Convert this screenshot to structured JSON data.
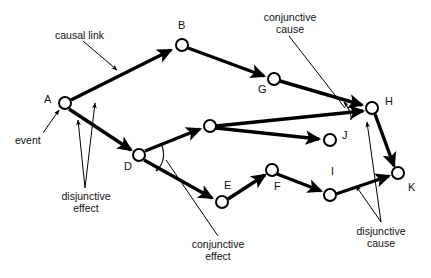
{
  "figure": {
    "type": "causal-network-diagram",
    "background": "#ffffff",
    "ink": "#000000",
    "width": 431,
    "height": 278
  },
  "nodes": [
    {
      "id": "A",
      "label": "A",
      "cx": 65,
      "cy": 103,
      "r": 6.0,
      "label_x": 44,
      "label_y": 94
    },
    {
      "id": "B",
      "label": "B",
      "cx": 182,
      "cy": 45,
      "r": 6.0,
      "label_x": 178,
      "label_y": 20
    },
    {
      "id": "G",
      "label": "G",
      "cx": 274,
      "cy": 79,
      "r": 6.0,
      "label_x": 258,
      "label_y": 84
    },
    {
      "id": "H",
      "label": "H",
      "cx": 372,
      "cy": 108,
      "r": 6.0,
      "label_x": 385,
      "label_y": 96
    },
    {
      "id": "C",
      "label": "",
      "cx": 210,
      "cy": 126,
      "r": 6.0,
      "label_x": 0,
      "label_y": 0
    },
    {
      "id": "D",
      "label": "D",
      "cx": 139,
      "cy": 155,
      "r": 6.0,
      "label_x": 124,
      "label_y": 161
    },
    {
      "id": "J",
      "label": "J",
      "cx": 330,
      "cy": 140,
      "r": 6.0,
      "label_x": 342,
      "label_y": 130
    },
    {
      "id": "E",
      "label": "E",
      "cx": 222,
      "cy": 202,
      "r": 6.0,
      "label_x": 224,
      "label_y": 180
    },
    {
      "id": "F",
      "label": "F",
      "cx": 272,
      "cy": 170,
      "r": 6.0,
      "label_x": 274,
      "label_y": 181
    },
    {
      "id": "I",
      "label": "I",
      "cx": 330,
      "cy": 195,
      "r": 6.0,
      "label_x": 331,
      "label_y": 166
    },
    {
      "id": "K",
      "label": "K",
      "cx": 398,
      "cy": 173,
      "r": 6.0,
      "label_x": 408,
      "label_y": 182
    }
  ],
  "edges": [
    {
      "from": "A",
      "to": "B",
      "kind": "causal-link"
    },
    {
      "from": "B",
      "to": "G",
      "kind": "causal-link"
    },
    {
      "from": "G",
      "to": "H",
      "kind": "causal-link"
    },
    {
      "from": "A",
      "to": "D",
      "kind": "causal-link"
    },
    {
      "from": "D",
      "to": "C",
      "kind": "causal-link"
    },
    {
      "from": "C",
      "to": "H",
      "kind": "causal-link"
    },
    {
      "from": "C",
      "to": "J",
      "kind": "causal-link"
    },
    {
      "from": "D",
      "to": "E",
      "kind": "causal-link"
    },
    {
      "from": "E",
      "to": "F",
      "kind": "causal-link"
    },
    {
      "from": "F",
      "to": "I",
      "kind": "causal-link"
    },
    {
      "from": "I",
      "to": "K",
      "kind": "causal-link"
    },
    {
      "from": "H",
      "to": "K",
      "kind": "causal-link"
    }
  ],
  "connective_arcs": [
    {
      "id": "conjunctive-effect-at-D",
      "note": "arc joining D->C and D->E"
    },
    {
      "id": "conjunctive-cause-at-H",
      "note": "arc joining G->H and C->H"
    }
  ],
  "annotations": [
    {
      "id": "causal-link",
      "text_line1": "causal  link",
      "text_line2": "",
      "x": 55,
      "y": 29,
      "align": "left"
    },
    {
      "id": "event",
      "text_line1": "event",
      "text_line2": "",
      "x": 15,
      "y": 134,
      "align": "left"
    },
    {
      "id": "disjunctive-effect",
      "text_line1": "disjunctive",
      "text_line2": "effect",
      "x": 36,
      "y": 190,
      "align": "center"
    },
    {
      "id": "conjunctive-effect",
      "text_line1": "conjunctive",
      "text_line2": "effect",
      "x": 168,
      "y": 238,
      "align": "center"
    },
    {
      "id": "conjunctive-cause",
      "text_line1": "conjunctive",
      "text_line2": "cause",
      "x": 240,
      "y": 11,
      "align": "center"
    },
    {
      "id": "disjunctive-cause",
      "text_line1": "disjunctive",
      "text_line2": "cause",
      "x": 333,
      "y": 225,
      "align": "center"
    }
  ]
}
